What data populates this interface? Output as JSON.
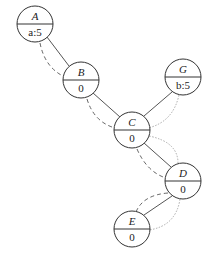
{
  "diagram": {
    "nodes": [
      {
        "id": "A",
        "label": "A",
        "value": "a:5",
        "cx": 35,
        "cy": 24
      },
      {
        "id": "B",
        "label": "B",
        "value": "0",
        "cx": 81,
        "cy": 80
      },
      {
        "id": "C",
        "label": "C",
        "value": "0",
        "cx": 132,
        "cy": 130
      },
      {
        "id": "G",
        "label": "G",
        "value": "b:5",
        "cx": 183,
        "cy": 77
      },
      {
        "id": "D",
        "label": "D",
        "value": "0",
        "cx": 183,
        "cy": 181
      },
      {
        "id": "E",
        "label": "E",
        "value": "0",
        "cx": 132,
        "cy": 229
      }
    ],
    "edges": [
      {
        "from": "A",
        "to": "B",
        "style": "solid"
      },
      {
        "from": "B",
        "to": "C",
        "style": "solid"
      },
      {
        "from": "G",
        "to": "C",
        "style": "solid"
      },
      {
        "from": "C",
        "to": "D",
        "style": "solid"
      },
      {
        "from": "D",
        "to": "E",
        "style": "solid"
      },
      {
        "from": "A",
        "to": "B",
        "style": "dashed"
      },
      {
        "from": "B",
        "to": "C",
        "style": "dashed"
      },
      {
        "from": "C",
        "to": "D",
        "style": "dashed"
      },
      {
        "from": "D",
        "to": "E",
        "style": "dashed"
      },
      {
        "from": "G",
        "to": "C",
        "style": "dotted"
      },
      {
        "from": "C",
        "to": "D",
        "style": "dotted"
      },
      {
        "from": "D",
        "to": "E",
        "style": "dotted"
      }
    ],
    "node_radius": 18,
    "colors": {
      "stroke": "#333333",
      "dashed": "#666666",
      "dotted": "#aaaaaa",
      "background": "#ffffff"
    }
  }
}
